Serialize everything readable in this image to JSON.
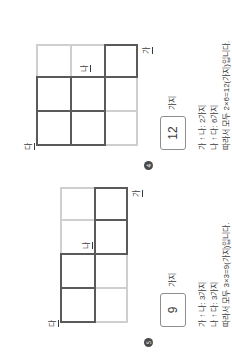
{
  "page": {
    "background_color": "#ffffff",
    "line_color_active": "#5a5a5a",
    "line_color_faded": "#cfcfcf",
    "text_color": "#3a3a3a"
  },
  "problems": [
    {
      "marker": "④",
      "marker_number": "4",
      "grid": {
        "rows": 3,
        "cols": 3
      },
      "labels": {
        "start": "가",
        "middle": "나",
        "end": "다"
      },
      "answer": {
        "value": "12",
        "unit": "가지"
      },
      "steps": [
        {
          "from": "가",
          "arrow": "↑",
          "to": "나",
          "count": "2가지",
          "text": "가 ↑ 나: 2가지"
        },
        {
          "from": "나",
          "arrow": "↑",
          "to": "다",
          "count": "6가지",
          "text": "나 ↑ 다: 6가지"
        }
      ],
      "summary": "따라서 모두 2×6=12(가지)입니다."
    },
    {
      "marker": "⑤",
      "marker_number": "5",
      "grid": {
        "rows": 2,
        "cols": 4
      },
      "labels": {
        "start": "가",
        "middle": "나",
        "end": "다"
      },
      "answer": {
        "value": "9",
        "unit": "가지"
      },
      "steps": [
        {
          "from": "가",
          "arrow": "↑",
          "to": "나",
          "count": "3가지",
          "text": "가 ↑ 나: 3가지"
        },
        {
          "from": "나",
          "arrow": "↑",
          "to": "다",
          "count": "3가지",
          "text": "나 ↑ 다: 3가지"
        }
      ],
      "summary": "따라서 모두 3×3=9(가지)입니다."
    }
  ]
}
